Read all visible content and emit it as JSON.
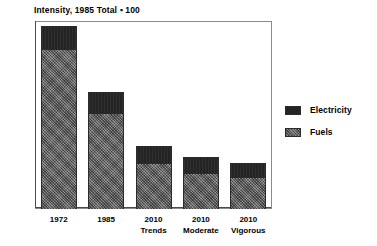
{
  "chart_data": {
    "type": "bar",
    "subtype": "stacked-vertical",
    "title": "Intensity, 1985 Total ▪ 100",
    "xlabel": "",
    "ylabel": "",
    "ylim": [
      0,
      160
    ],
    "ytick_step": 20,
    "yticks": [
      "160",
      "140",
      "120",
      "100",
      "80",
      "60",
      "40",
      "20",
      "0"
    ],
    "ytick_values": [
      160,
      140,
      120,
      100,
      80,
      60,
      40,
      20,
      0
    ],
    "grid": false,
    "legend_position": "right",
    "categories": [
      "1972",
      "1985",
      "2010 Trends",
      "2010 Moderate",
      "2010 Vigorous"
    ],
    "category_labels": [
      {
        "line1": "1972",
        "line2": ""
      },
      {
        "line1": "1985",
        "line2": ""
      },
      {
        "line1": "2010",
        "line2": "Trends"
      },
      {
        "line1": "2010",
        "line2": "Moderate"
      },
      {
        "line1": "2010",
        "line2": "Vigorous"
      }
    ],
    "series": [
      {
        "name": "Fuels",
        "color": "#6f6f6f",
        "values": [
          136,
          82,
          39,
          31,
          27
        ]
      },
      {
        "name": "Electricity",
        "color": "#242424",
        "values": [
          20,
          18,
          15,
          13,
          12
        ]
      }
    ],
    "totals": [
      156,
      100,
      54,
      44,
      39
    ],
    "legend_order": [
      "Electricity",
      "Fuels"
    ]
  },
  "legend": {
    "items": [
      {
        "label": "Electricity",
        "swatch": "electricity"
      },
      {
        "label": "Fuels",
        "swatch": "fuels"
      }
    ]
  }
}
